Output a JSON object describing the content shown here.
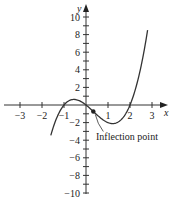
{
  "chart_data": {
    "type": "line",
    "title": "",
    "function": "y = x^3 - x^2 - 2x",
    "xlabel": "x",
    "ylabel": "y",
    "xlim": [
      -3.3,
      3.5
    ],
    "ylim": [
      -10.5,
      11
    ],
    "x_ticks": [
      -3,
      -2,
      -1,
      1,
      2,
      3
    ],
    "x_tick_labels": [
      "−3",
      "−2",
      "−1",
      "1",
      "2",
      "3"
    ],
    "y_ticks": [
      -10,
      -8,
      -6,
      -4,
      -2,
      2,
      4,
      6,
      8,
      10
    ],
    "y_tick_labels": [
      "−10",
      "−8",
      "−6",
      "−4",
      "−2",
      "2",
      "4",
      "6",
      "8",
      "10"
    ],
    "y_minor_step": 1,
    "grid": false,
    "legend": null,
    "series": [
      {
        "name": "f(x)",
        "x": [
          -1.6,
          -1.4,
          -1.2,
          -1.0,
          -0.8,
          -0.6,
          -0.4,
          -0.2,
          0.0,
          0.2,
          0.4,
          0.6,
          0.8,
          1.0,
          1.2,
          1.4,
          1.6,
          1.8,
          2.0,
          2.2,
          2.4,
          2.6,
          2.8
        ],
        "values": [
          -3.456,
          -1.904,
          -0.768,
          0.0,
          0.448,
          0.624,
          0.576,
          0.352,
          0.0,
          -0.432,
          -0.896,
          -1.344,
          -1.728,
          -2.0,
          -2.112,
          -2.016,
          -1.664,
          -1.008,
          0.0,
          1.408,
          3.264,
          5.616,
          8.512
        ]
      }
    ],
    "annotations": [
      {
        "text": "Inflection point",
        "x": 0.333,
        "y": -0.741
      }
    ]
  }
}
